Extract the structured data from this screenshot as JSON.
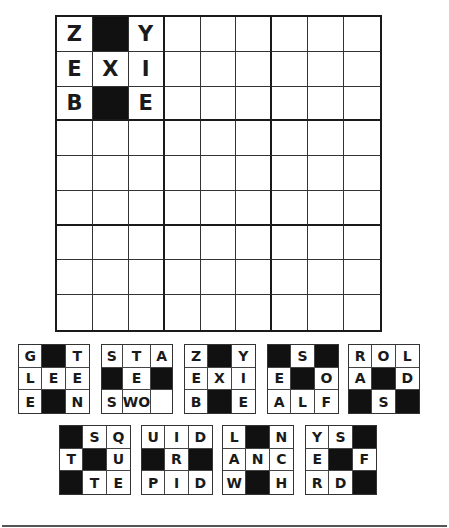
{
  "board": {
    "rows": 9,
    "cols": 9,
    "cells": [
      [
        "Z",
        "#",
        "Y",
        "",
        "",
        "",
        "",
        "",
        ""
      ],
      [
        "E",
        "X",
        "I",
        "",
        "",
        "",
        "",
        "",
        ""
      ],
      [
        "B",
        "#",
        "E",
        "",
        "",
        "",
        "",
        "",
        ""
      ],
      [
        "",
        "",
        "",
        "",
        "",
        "",
        "",
        "",
        ""
      ],
      [
        "",
        "",
        "",
        "",
        "",
        "",
        "",
        "",
        ""
      ],
      [
        "",
        "",
        "",
        "",
        "",
        "",
        "",
        "",
        ""
      ],
      [
        "",
        "",
        "",
        "",
        "",
        "",
        "",
        "",
        ""
      ],
      [
        "",
        "",
        "",
        "",
        "",
        "",
        "",
        "",
        ""
      ],
      [
        "",
        "",
        "",
        "",
        "",
        "",
        "",
        "",
        ""
      ]
    ]
  },
  "pieces": [
    {
      "x": 18,
      "y": 344,
      "cells": [
        [
          "G",
          "#",
          "T"
        ],
        [
          "L",
          "E",
          "E"
        ],
        [
          "E",
          "#",
          "N"
        ]
      ]
    },
    {
      "x": 101,
      "y": 344,
      "cells": [
        [
          "S",
          "T",
          "A"
        ],
        [
          "#",
          "E",
          "#"
        ],
        [
          "S",
          "WO",
          ""
        ]
      ]
    },
    {
      "x": 184,
      "y": 344,
      "cells": [
        [
          "Z",
          "#",
          "Y"
        ],
        [
          "E",
          "X",
          "I"
        ],
        [
          "B",
          "#",
          "E"
        ]
      ]
    },
    {
      "x": 267,
      "y": 344,
      "cells": [
        [
          "#",
          "S",
          "#"
        ],
        [
          "E",
          "#",
          "O"
        ],
        [
          "A",
          "L",
          "F"
        ]
      ]
    },
    {
      "x": 348,
      "y": 344,
      "cells": [
        [
          "R",
          "O",
          "L"
        ],
        [
          "A",
          "#",
          "D"
        ],
        [
          "#",
          "S",
          "#"
        ]
      ]
    },
    {
      "x": 59,
      "y": 425,
      "cells": [
        [
          "#",
          "S",
          "Q"
        ],
        [
          "T",
          "#",
          "U"
        ],
        [
          "#",
          "T",
          "E"
        ]
      ]
    },
    {
      "x": 141,
      "y": 425,
      "cells": [
        [
          "U",
          "I",
          "D"
        ],
        [
          "#",
          "R",
          "#"
        ],
        [
          "P",
          "I",
          "D"
        ]
      ]
    },
    {
      "x": 222,
      "y": 425,
      "cells": [
        [
          "L",
          "#",
          "N"
        ],
        [
          "A",
          "N",
          "C"
        ],
        [
          "W",
          "#",
          "H"
        ]
      ]
    },
    {
      "x": 305,
      "y": 425,
      "cells": [
        [
          "Y",
          "S",
          "#"
        ],
        [
          "E",
          "#",
          "F"
        ],
        [
          "R",
          "D",
          "#"
        ]
      ]
    }
  ],
  "colors": {
    "black_cell": "#111111",
    "line": "#1a1a1a"
  }
}
